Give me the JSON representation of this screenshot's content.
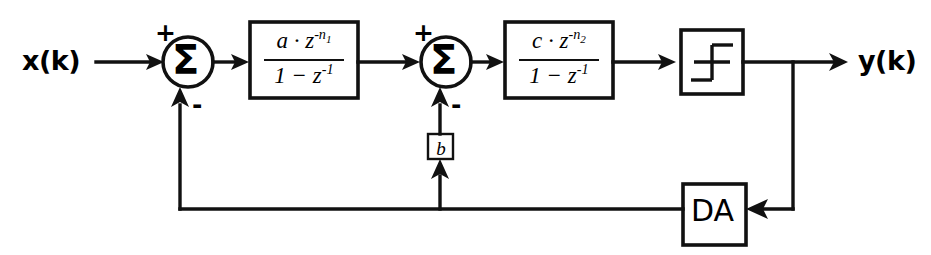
{
  "diagram": {
    "input_label": "x(k)",
    "output_label": "y(k)",
    "ink_color": "#111111",
    "background_color": "#ffffff",
    "summing_junctions": [
      {
        "id": "sum1",
        "glyph": "Σ",
        "forward_sign": "+",
        "feedback_sign": "-"
      },
      {
        "id": "sum2",
        "glyph": "Σ",
        "forward_sign": "+",
        "feedback_sign": "-"
      }
    ],
    "blocks": [
      {
        "id": "tf1",
        "kind": "transfer-function",
        "numerator_coeff": "a",
        "numerator_var": "z",
        "numerator_exponent": "-n",
        "numerator_exponent_sub": "1",
        "denominator": "1 − z",
        "denominator_exponent": "-1"
      },
      {
        "id": "tf2",
        "kind": "transfer-function",
        "numerator_coeff": "c",
        "numerator_var": "z",
        "numerator_exponent": "-n",
        "numerator_exponent_sub": "2",
        "denominator": "1 − z",
        "denominator_exponent": "-1"
      },
      {
        "id": "gain_b",
        "kind": "gain",
        "label": "b"
      },
      {
        "id": "quantizer",
        "kind": "quantizer",
        "label": "",
        "symbol": "step-quantizer"
      },
      {
        "id": "da",
        "kind": "converter",
        "label": "DA"
      }
    ]
  }
}
